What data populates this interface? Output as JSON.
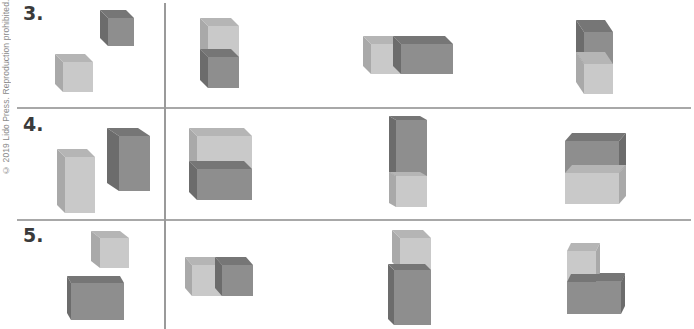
{
  "copyright": "© 2019 Lido Press. Reproduction prohibited.",
  "colors": {
    "light_front": "#c9c9c9",
    "light_side": "#a9a9a9",
    "light_top": "#b5b5b5",
    "dark_front": "#8e8e8e",
    "dark_side": "#6c6c6c",
    "dark_top": "#767676",
    "rule": "#a8a8a8"
  },
  "problems": [
    {
      "number": "3.",
      "given": [
        {
          "x": 108,
          "y": 18,
          "w": 26,
          "h": 28,
          "dx": -8,
          "dy": -8,
          "shade": "dark",
          "side": "left"
        },
        {
          "x": 63,
          "y": 62,
          "w": 30,
          "h": 30,
          "dx": -8,
          "dy": -8,
          "shade": "light",
          "side": "left"
        }
      ],
      "options": [
        {
          "label": "A",
          "blocks": [
            {
              "x": 208,
              "y": 26,
              "w": 31,
              "h": 31,
              "dx": -8,
              "dy": -8,
              "shade": "light",
              "side": "left"
            },
            {
              "x": 208,
              "y": 57,
              "w": 31,
              "h": 31,
              "dx": -8,
              "dy": -8,
              "shade": "dark",
              "side": "left"
            }
          ]
        },
        {
          "label": "B",
          "blocks": [
            {
              "x": 371,
              "y": 44,
              "w": 30,
              "h": 30,
              "dx": -8,
              "dy": -8,
              "shade": "light",
              "side": "left"
            },
            {
              "x": 401,
              "y": 44,
              "w": 52,
              "h": 30,
              "dx": -8,
              "dy": -8,
              "shade": "dark",
              "side": "left"
            }
          ]
        },
        {
          "label": "C",
          "blocks": [
            {
              "x": 584,
              "y": 32,
              "w": 29,
              "h": 32,
              "dx": -8,
              "dy": -12,
              "shade": "dark",
              "side": "left"
            },
            {
              "x": 584,
              "y": 64,
              "w": 29,
              "h": 30,
              "dx": -8,
              "dy": -12,
              "shade": "light",
              "side": "left"
            }
          ]
        }
      ]
    },
    {
      "number": "4.",
      "given": [
        {
          "x": 119,
          "y": 136,
          "w": 31,
          "h": 55,
          "dx": -12,
          "dy": -8,
          "shade": "dark",
          "side": "left"
        },
        {
          "x": 65,
          "y": 157,
          "w": 30,
          "h": 56,
          "dx": -8,
          "dy": -8,
          "shade": "light",
          "side": "left"
        }
      ],
      "options": [
        {
          "label": "A",
          "blocks": [
            {
              "x": 197,
              "y": 136,
              "w": 55,
              "h": 33,
              "dx": -8,
              "dy": -8,
              "shade": "light",
              "side": "left"
            },
            {
              "x": 197,
              "y": 169,
              "w": 55,
              "h": 31,
              "dx": -8,
              "dy": -8,
              "shade": "dark",
              "side": "left"
            }
          ]
        },
        {
          "label": "B",
          "blocks": [
            {
              "x": 396,
              "y": 120,
              "w": 31,
              "h": 56,
              "dx": -7,
              "dy": -4,
              "shade": "dark",
              "side": "left"
            },
            {
              "x": 396,
              "y": 176,
              "w": 31,
              "h": 31,
              "dx": -7,
              "dy": -4,
              "shade": "light",
              "side": "left"
            }
          ]
        },
        {
          "label": "C",
          "blocks": [
            {
              "x": 565,
              "y": 141,
              "w": 54,
              "h": 32,
              "dx": 7,
              "dy": -8,
              "shade": "dark",
              "side": "right"
            },
            {
              "x": 565,
              "y": 173,
              "w": 54,
              "h": 31,
              "dx": 7,
              "dy": -8,
              "shade": "light",
              "side": "right"
            }
          ]
        }
      ]
    },
    {
      "number": "5.",
      "given": [
        {
          "x": 100,
          "y": 238,
          "w": 29,
          "h": 30,
          "dx": -9,
          "dy": -7,
          "shade": "light",
          "side": "left"
        },
        {
          "x": 71,
          "y": 283,
          "w": 53,
          "h": 37,
          "dx": -4,
          "dy": -7,
          "shade": "dark",
          "side": "left"
        }
      ],
      "options": [
        {
          "label": "A",
          "blocks": [
            {
              "x": 192,
              "y": 265,
              "w": 30,
              "h": 31,
              "dx": -7,
              "dy": -8,
              "shade": "light",
              "side": "left"
            },
            {
              "x": 222,
              "y": 265,
              "w": 31,
              "h": 31,
              "dx": -7,
              "dy": -8,
              "shade": "dark",
              "side": "left"
            }
          ]
        },
        {
          "label": "B",
          "blocks": [
            {
              "x": 400,
              "y": 238,
              "w": 31,
              "h": 32,
              "dx": -8,
              "dy": -8,
              "shade": "light",
              "side": "left"
            },
            {
              "x": 394,
              "y": 270,
              "w": 37,
              "h": 55,
              "dx": -6,
              "dy": -6,
              "shade": "dark",
              "side": "left"
            }
          ]
        },
        {
          "label": "C",
          "blocks": [
            {
              "x": 567,
              "y": 251,
              "w": 29,
              "h": 31,
              "dx": 4,
              "dy": -8,
              "shade": "light",
              "side": "right"
            },
            {
              "x": 567,
              "y": 282,
              "w": 54,
              "h": 32,
              "dx": 4,
              "dy": -8,
              "shade": "dark",
              "side": "right"
            },
            {
              "x": 596,
              "y": 281,
              "w": 25,
              "h": 1,
              "dx": 4,
              "dy": -8,
              "shade": "dark",
              "side": "right"
            }
          ]
        }
      ]
    }
  ]
}
